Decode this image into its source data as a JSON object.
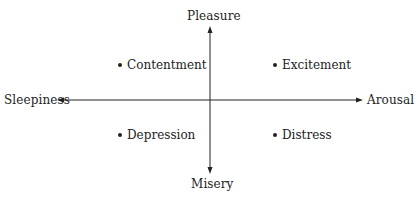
{
  "axes": {
    "top": "Pleasure",
    "bottom": "Misery",
    "left": "Sleepiness",
    "right": "Arousal"
  },
  "quadrants": {
    "top_left": "Contentment",
    "top_right": "Excitement",
    "bottom_left": "Depression",
    "bottom_right": "Distress"
  },
  "colors": {
    "line": "#222222",
    "text": "#222222",
    "background": "#ffffff"
  }
}
